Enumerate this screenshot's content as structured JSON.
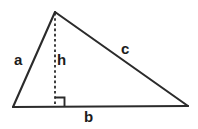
{
  "diagram": {
    "type": "geometry-triangle",
    "stroke_color": "#2b2b2b",
    "label_color": "#1c1c1c",
    "background_color": "#ffffff",
    "labels": {
      "side_a": "a",
      "height_h": "h",
      "side_c": "c",
      "base_b": "b"
    },
    "geometry": {
      "apex": [
        55,
        12
      ],
      "bottom_left": [
        13,
        107
      ],
      "bottom_right": [
        188,
        106
      ],
      "foot_of_altitude": [
        55,
        107
      ],
      "right_angle_marker": [
        55,
        97,
        9,
        9
      ]
    }
  }
}
